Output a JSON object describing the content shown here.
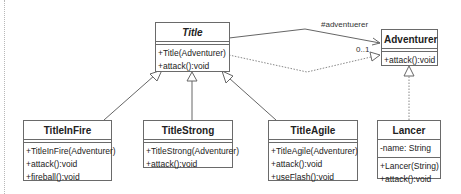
{
  "diagram": {
    "type": "uml-class-diagram",
    "classes": {
      "title": {
        "name": "Title",
        "abstract": true,
        "attributes": [],
        "operations": [
          "+Title(Adventurer)",
          "+attack():void"
        ]
      },
      "adventurer": {
        "name": "Adventurer",
        "attributes": [],
        "operations": [
          "+attack():void"
        ]
      },
      "title_in_fire": {
        "name": "TitleInFire",
        "attributes": [],
        "operations": [
          "+TitleInFire(Adventurer)",
          "+attack():void",
          "+fireball():void"
        ]
      },
      "title_strong": {
        "name": "TitleStrong",
        "attributes": [],
        "operations": [
          "+TitleStrong(Adventurer)",
          "+attack():void"
        ]
      },
      "title_agile": {
        "name": "TitleAgile",
        "attributes": [],
        "operations": [
          "+TitleAgile(Adventurer)",
          "+attack():void",
          "+useFlash():void"
        ]
      },
      "lancer": {
        "name": "Lancer",
        "attributes": [
          "-name: String"
        ],
        "operations": [
          "+Lancer(String)",
          "+attack():void"
        ]
      }
    },
    "relationships": [
      {
        "from": "Title",
        "to": "Adventurer",
        "kind": "association",
        "role": "#adventuerer",
        "multiplicity": "0..1"
      },
      {
        "from": "Title",
        "to": "Adventurer",
        "kind": "realization"
      },
      {
        "from": "TitleInFire",
        "to": "Title",
        "kind": "generalization"
      },
      {
        "from": "TitleStrong",
        "to": "Title",
        "kind": "generalization"
      },
      {
        "from": "TitleAgile",
        "to": "Title",
        "kind": "generalization"
      },
      {
        "from": "Lancer",
        "to": "Adventurer",
        "kind": "realization"
      }
    ],
    "labels": {
      "association_role": "#adventuerer",
      "association_multiplicity": "0..1"
    }
  }
}
